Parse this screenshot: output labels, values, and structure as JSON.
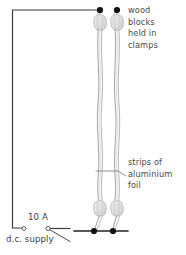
{
  "diagram": {
    "labels": {
      "wood_blocks": "wood\nblocks\nheld in\nclamps",
      "strips_foil": "strips of\naluminium\nfoil",
      "current_rating": "10 A",
      "dc_supply": "d.c. supply"
    },
    "colors": {
      "wire": "#3a3a3a",
      "terminal_dot": "#111111",
      "foil_strip": "#9a9a9a",
      "wood_block_fill": "#e2e2e2",
      "wood_block_stroke": "#b5b5b5",
      "leader_line": "#6f6f6f",
      "text": "#4a4a4a",
      "background": "#ffffff"
    },
    "components": {
      "foil_strips": [
        {
          "name": "left-foil-strip",
          "x": 100
        },
        {
          "name": "right-foil-strip",
          "x": 117
        }
      ],
      "terminals_top": [
        {
          "name": "top-left-terminal",
          "x": 100,
          "y": 10
        },
        {
          "name": "top-right-terminal",
          "x": 117,
          "y": 10
        }
      ],
      "terminals_bottom": [
        {
          "name": "bottom-left-terminal",
          "x": 94,
          "y": 231
        },
        {
          "name": "bottom-right-terminal",
          "x": 113,
          "y": 231
        }
      ],
      "wood_blocks": [
        {
          "name": "top-left-wood-block",
          "x": 100,
          "y": 22
        },
        {
          "name": "top-right-wood-block",
          "x": 117,
          "y": 22
        },
        {
          "name": "bottom-left-wood-block",
          "x": 100,
          "y": 209
        },
        {
          "name": "bottom-right-wood-block",
          "x": 117,
          "y": 209
        }
      ],
      "switch": {
        "name": "switch",
        "left_terminal": {
          "x": 24,
          "y": 228
        },
        "right_terminal": {
          "x": 48,
          "y": 228
        },
        "lever_end": {
          "x": 70,
          "y": 240
        }
      },
      "circuit_path": {
        "name": "supply-circuit-wire",
        "points": "100,10 12,10 12,228 24,228"
      },
      "bottom_wire": {
        "name": "bottom-circuit-wire",
        "points": "48,228 70,228 128,231"
      }
    },
    "leader_lines": [
      {
        "name": "foil-leader-line",
        "from_x": 126,
        "to_x": 96,
        "y": 171
      }
    ]
  }
}
